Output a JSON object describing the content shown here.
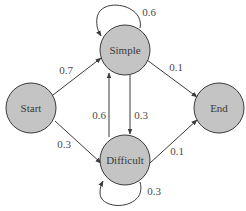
{
  "diagram": {
    "type": "state-transition-diagram",
    "colors": {
      "node_fill": "#c4c4c4",
      "stroke": "#3a3a3a",
      "background": "#ffffff"
    },
    "nodes": [
      {
        "id": "start",
        "label": "Start"
      },
      {
        "id": "simple",
        "label": "Simple"
      },
      {
        "id": "difficult",
        "label": "Difficult"
      },
      {
        "id": "end",
        "label": "End"
      }
    ],
    "edges": [
      {
        "from": "start",
        "to": "simple",
        "label": "0.7"
      },
      {
        "from": "start",
        "to": "difficult",
        "label": "0.3"
      },
      {
        "from": "simple",
        "to": "simple",
        "label": "0.6"
      },
      {
        "from": "simple",
        "to": "difficult",
        "label": "0.3"
      },
      {
        "from": "simple",
        "to": "end",
        "label": "0.1"
      },
      {
        "from": "difficult",
        "to": "simple",
        "label": "0.6"
      },
      {
        "from": "difficult",
        "to": "difficult",
        "label": "0.3"
      },
      {
        "from": "difficult",
        "to": "end",
        "label": "0.1"
      }
    ]
  }
}
